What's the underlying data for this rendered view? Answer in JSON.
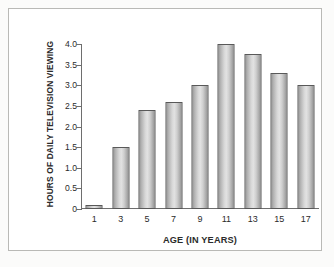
{
  "chart_data": {
    "type": "bar",
    "title": "",
    "categories": [
      "1",
      "3",
      "5",
      "7",
      "9",
      "11",
      "13",
      "15",
      "17"
    ],
    "values": [
      0.1,
      1.5,
      2.4,
      2.6,
      3.0,
      4.0,
      3.75,
      3.3,
      3.0
    ],
    "xlabel": "AGE (IN YEARS)",
    "ylabel": "HOURS OF DAILY TELEVISION VIEWING",
    "ylim": [
      0,
      4.0
    ],
    "ytick_values": [
      4.0,
      3.5,
      3.0,
      2.5,
      2.0,
      1.5,
      1.0,
      0.5,
      0
    ],
    "ytick_labels": [
      "4.0",
      "3.5",
      "3.0",
      "2.5",
      "2.0",
      "1.5",
      "1.0",
      "0.5",
      "0"
    ],
    "grid": false,
    "legend": false,
    "colors": {
      "bar_fill_light": "#e2e2e2",
      "bar_fill_dark": "#969696",
      "bar_outline": "#595959",
      "axis": "#6e6e6e",
      "text": "#2b2b2b",
      "frame": "#b9b9b6",
      "plot_background": "#ffffff",
      "page_background": "#fbfbfa"
    }
  }
}
